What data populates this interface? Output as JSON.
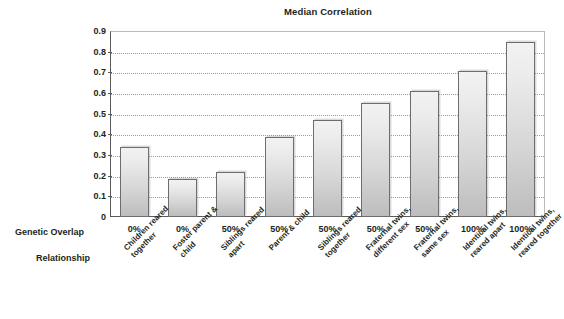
{
  "chart": {
    "title": "Median Correlation",
    "row_headers": {
      "genetic_overlap": "Genetic Overlap",
      "relationship": "Relationship"
    }
  },
  "chart_data": {
    "type": "bar",
    "title": "Median Correlation",
    "xlabel": "",
    "ylabel": "",
    "ylim": [
      0,
      0.9
    ],
    "grid": true,
    "legend": "none",
    "ytick_labels": [
      "0.9",
      "0.8",
      "0.7",
      "0.6",
      "0.5",
      "0.4",
      "0.3",
      "0.2",
      "0.1",
      "0"
    ],
    "ytick_values": [
      0.9,
      0.8,
      0.7,
      0.6,
      0.5,
      0.4,
      0.3,
      0.2,
      0.1,
      0
    ],
    "categories": [
      "Children reared together",
      "Foster parent & child",
      "Siblings reared apart",
      "Parent & child",
      "Siblings reared together",
      "Fraternal twins, different sex",
      "Fraternal twins, same sex",
      "Identical twins, reared apart",
      "Identical twins, reared together"
    ],
    "category_lines": [
      [
        "Children reared",
        "together"
      ],
      [
        "Foster parent &",
        "child"
      ],
      [
        "Siblings reared",
        "apart"
      ],
      [
        "Parent & child"
      ],
      [
        "Siblings reared",
        "together"
      ],
      [
        "Fraternal twins,",
        "different sex"
      ],
      [
        "Fraternal twins,",
        "same sex"
      ],
      [
        "Identical twins,",
        "reared apart"
      ],
      [
        "Identical twins,",
        "reared together"
      ]
    ],
    "genetic_overlap": [
      "0%",
      "0%",
      "50%",
      "50%",
      "50%",
      "50%",
      "50%",
      "100%",
      "100%"
    ],
    "values": [
      0.34,
      0.185,
      0.22,
      0.385,
      0.47,
      0.55,
      0.61,
      0.705,
      0.845
    ]
  },
  "colors": {
    "bar_top": "#f2f2f2",
    "bar_bottom": "#bdbdbd",
    "bar_border": "#6d6d6d",
    "axis": "#5a5a5a",
    "gridline": "#9a9a9a",
    "text": "#231f20",
    "background": "#ffffff"
  }
}
